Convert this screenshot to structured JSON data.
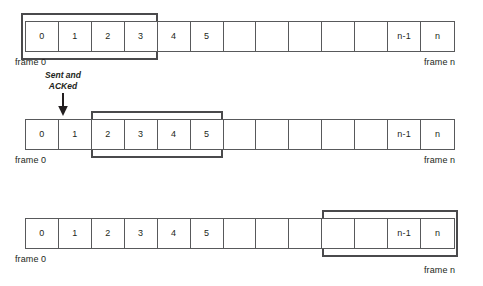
{
  "diagram": {
    "type": "sliding-window-diagram",
    "canvas": {
      "width": 483,
      "height": 286
    },
    "colors": {
      "cell_border": "#58595b",
      "window_border": "#4a4a4c",
      "text": "#231f20",
      "background": "#ffffff"
    },
    "cell_labels": [
      "0",
      "1",
      "2",
      "3",
      "4",
      "5",
      "",
      "",
      "",
      "",
      "",
      "n-1",
      "n"
    ],
    "cell_count": 13,
    "labels": {
      "frame_first": "frame 0",
      "frame_last": "frame n"
    },
    "annotation": {
      "line1": "Sent and",
      "line2": "ACKed",
      "arrow_icon": "down-arrow-icon"
    },
    "rows": [
      {
        "id": "row-1",
        "window_start_index": 0,
        "window_end_index": 3,
        "window_label": "window over frames 0-3"
      },
      {
        "id": "row-2",
        "window_start_index": 2,
        "window_end_index": 5,
        "window_label": "window over frames 2-5"
      },
      {
        "id": "row-3",
        "window_start_index": 9,
        "window_end_index": 12,
        "window_label": "window over frames n-3 to n"
      }
    ]
  }
}
